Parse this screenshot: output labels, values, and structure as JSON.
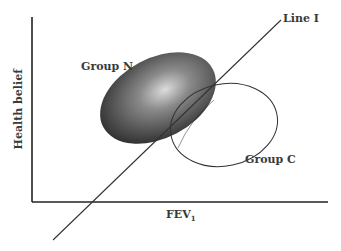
{
  "figure": {
    "y_axis_label": "Health belief",
    "x_axis_label": "FEV",
    "x_axis_label_subscript": "1",
    "line_label": "Line I",
    "groups": [
      {
        "label": "Group N",
        "style": "filled-shaded-ellipse",
        "fill_dark": "#333333",
        "fill_light": "#d8d8d8"
      },
      {
        "label": "Group C",
        "style": "outline-ellipse",
        "stroke": "#333333"
      }
    ],
    "colors": {
      "axis": "#222222",
      "line": "#333333",
      "text": "#3a3a3a"
    }
  }
}
